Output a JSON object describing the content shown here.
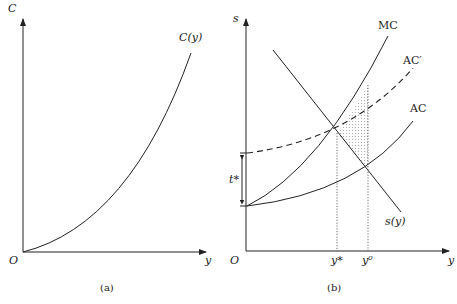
{
  "panel_a": {
    "y_axis_label": "C",
    "x_axis_label": "y",
    "origin_label": "O",
    "curve_label": "C(y)",
    "caption": "(a)"
  },
  "panel_b": {
    "y_axis_label": "s",
    "x_axis_label": "y",
    "origin_label": "O",
    "curves": {
      "mc": "MC",
      "ac_prime": "AC′",
      "ac": "AC",
      "supply": "s(y)"
    },
    "tax_label": "t*",
    "x_ticks": [
      "y*",
      "y⁰"
    ],
    "caption": "(b)"
  },
  "colors": {
    "ink": "#222222",
    "background": "#ffffff"
  }
}
